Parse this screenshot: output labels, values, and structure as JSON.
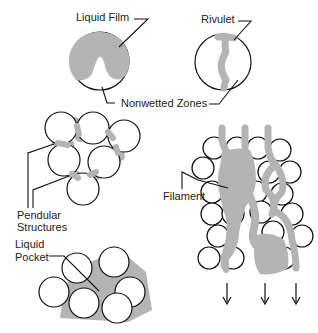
{
  "colors": {
    "liquid": "#b4b4b4",
    "outline": "#111111",
    "background": "#ffffff"
  },
  "labels": {
    "liquid_film": "Liquid Film",
    "rivulet": "Rivulet",
    "nonwetted_zones": "Nonwetted Zones",
    "pendular_line1": "Pendular",
    "pendular_line2": "Structures",
    "filament": "Filament",
    "liquid_pocket_line1": "Liquid",
    "liquid_pocket_line2": "Pocket"
  },
  "panels": [
    {
      "id": "liquid-film",
      "description": "Single particle covered by liquid film with nonwetted zone"
    },
    {
      "id": "rivulet",
      "description": "Single particle with rivulet flowing across surface"
    },
    {
      "id": "pendular-structures",
      "description": "Cluster of 6 particles joined by liquid bridges"
    },
    {
      "id": "liquid-pocket",
      "description": "Cluster of 6 particles enclosing a liquid pocket"
    },
    {
      "id": "filament",
      "description": "Packed bed with liquid filaments flowing downward"
    }
  ],
  "flow_arrows": {
    "count": 3,
    "direction": "down"
  }
}
